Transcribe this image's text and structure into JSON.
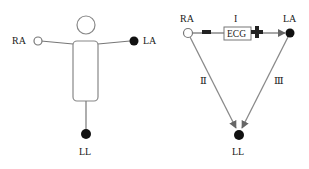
{
  "left_figure": {
    "title": "body electrode placement",
    "labels": {
      "ra": "RA",
      "la": "LA",
      "ll": "LL"
    }
  },
  "right_figure": {
    "title": "Einthoven triangle",
    "labels": {
      "ra": "RA",
      "la": "LA",
      "ll": "LL"
    },
    "leads": {
      "lead1": "I",
      "lead2": "Ⅱ",
      "lead3": "Ⅲ"
    },
    "ecg_box": "ECG",
    "negative_sign": "−",
    "positive_sign": "+"
  },
  "colors": {
    "line": "#8a8a8a",
    "outline": "#777777",
    "electrode_filled": "#111111",
    "electrode_open": "#ffffff",
    "text": "#222222"
  }
}
